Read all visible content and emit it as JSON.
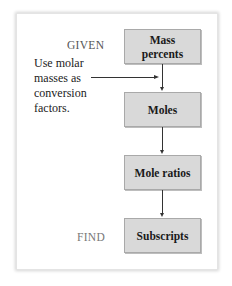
{
  "diagram": {
    "given_label": "GIVEN",
    "find_label": "FIND",
    "note": {
      "lines": [
        "Use molar",
        "masses as",
        "conversion",
        "factors."
      ]
    },
    "steps": [
      {
        "line1": "Mass",
        "line2": "percents"
      },
      {
        "line1": "Moles"
      },
      {
        "line1": "Mole ratios"
      },
      {
        "line1": "Subscripts"
      }
    ],
    "colors": {
      "box_fill": "#d9d9d9",
      "box_border": "#a9a9a9",
      "arrow": "#333333",
      "given_text": "#555555",
      "find_text": "#777777"
    }
  }
}
